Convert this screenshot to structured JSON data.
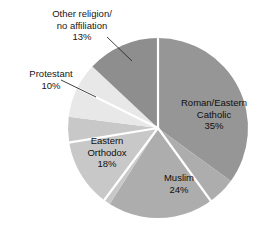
{
  "chart_data": {
    "type": "pie",
    "title": "",
    "subtitle": "",
    "xlabel": "",
    "ylabel": "",
    "legend_position": "none",
    "grid": false,
    "units": "percent",
    "total": 100,
    "start_angle_deg": 0,
    "direction": "clockwise",
    "categories": [
      "Roman/Eastern Catholic",
      "Muslim",
      "Eastern Orthodox",
      "Protestant",
      "Other religion/no affiliation"
    ],
    "values": [
      35,
      24,
      18,
      10,
      13
    ],
    "slices": [
      {
        "label_line1": "Roman/Eastern",
        "label_line2": "Catholic",
        "value_text": "35%",
        "value": 35,
        "color": "#969696",
        "label_placement": "inside"
      },
      {
        "label_line1": "Muslim",
        "label_line2": "",
        "value_text": "24%",
        "value": 24,
        "color": "#adadad",
        "label_placement": "inside"
      },
      {
        "label_line1": "Eastern",
        "label_line2": "Orthodox",
        "value_text": "18%",
        "value": 18,
        "color": "#c8c8c8",
        "label_placement": "inside"
      },
      {
        "label_line1": "Protestant",
        "label_line2": "",
        "value_text": "10%",
        "value": 10,
        "color": "#e8e8e8",
        "label_placement": "outside-leader"
      },
      {
        "label_line1": "Other religion/",
        "label_line2": "no affiliation",
        "value_text": "13%",
        "value": 13,
        "color": "#8e8e8e",
        "label_placement": "outside-leader"
      }
    ],
    "divider_color": "#ffffff",
    "leader_line_color": "#2b2b2b",
    "background": "#ffffff"
  }
}
